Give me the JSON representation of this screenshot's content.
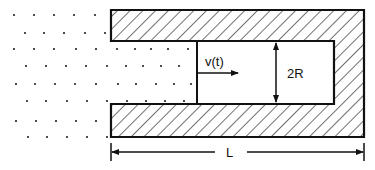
{
  "diagram": {
    "labels": {
      "velocity": "v(t)",
      "diameter": "2R",
      "length": "L"
    },
    "colors": {
      "stroke": "#111111",
      "background": "#ffffff",
      "hatch": "#111111",
      "dots": "#222222"
    },
    "geometry": {
      "outer": {
        "left": 111,
        "top": 10,
        "right": 364,
        "bottom": 137
      },
      "cavity": {
        "left": 197,
        "top": 41,
        "right": 334,
        "bottom": 104
      },
      "open_end_x": 111,
      "piston_x": 197,
      "velocity_arrow": {
        "x1": 198,
        "x2": 238,
        "y": 73
      },
      "diameter_arrow": {
        "x": 276,
        "y1": 42,
        "y2": 103
      },
      "length_dimension": {
        "x1": 111,
        "x2": 364,
        "y": 152
      }
    },
    "particles": {
      "rows": [
        {
          "y": 15,
          "xs": [
            14,
            34,
            54,
            74,
            95
          ]
        },
        {
          "y": 33,
          "xs": [
            25,
            44,
            64,
            85,
            105
          ]
        },
        {
          "y": 49,
          "xs": [
            14,
            34,
            54,
            76,
            96,
            117,
            135,
            151,
            168,
            188
          ]
        },
        {
          "y": 66,
          "xs": [
            26,
            46,
            66,
            86,
            107,
            126,
            143,
            161,
            179
          ]
        },
        {
          "y": 84,
          "xs": [
            16,
            35,
            55,
            75,
            96,
            118,
            136,
            156,
            174,
            191
          ]
        },
        {
          "y": 101,
          "xs": [
            27,
            46,
            67,
            87,
            107,
            127,
            146,
            165,
            184
          ]
        },
        {
          "y": 121,
          "xs": [
            16,
            36,
            56,
            76,
            96
          ]
        },
        {
          "y": 137,
          "xs": [
            28,
            47,
            67,
            87,
            107
          ]
        }
      ]
    }
  }
}
